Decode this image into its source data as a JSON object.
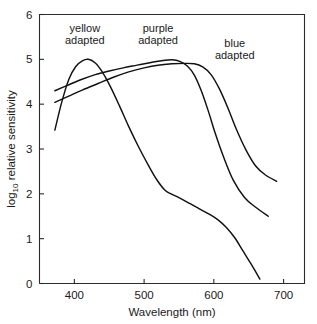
{
  "chart_data": {
    "type": "line",
    "title": "",
    "xlabel": "Wavelength (nm)",
    "ylabel_main": "log",
    "ylabel_sub": "10",
    "ylabel_rest": " relative sensitivity",
    "ylabel_full": "log10 relative sensitivity",
    "xlim": [
      350,
      730
    ],
    "ylim": [
      0,
      6
    ],
    "xticks": [
      400,
      500,
      600,
      700
    ],
    "yticks": [
      0,
      1,
      2,
      3,
      4,
      5,
      6
    ],
    "xtick_labels": [
      "400",
      "500",
      "600",
      "700"
    ],
    "ytick_labels": [
      "0",
      "1",
      "2",
      "3",
      "4",
      "5",
      "6"
    ],
    "grid": false,
    "legend_position": "inline-annotations",
    "series": [
      {
        "name": "yellow adapted",
        "label_line1": "yellow",
        "label_line2": "adapted",
        "color": "#111111",
        "points": [
          [
            372,
            3.42
          ],
          [
            382,
            4.05
          ],
          [
            392,
            4.55
          ],
          [
            402,
            4.84
          ],
          [
            412,
            4.97
          ],
          [
            420,
            5.0
          ],
          [
            430,
            4.92
          ],
          [
            440,
            4.72
          ],
          [
            452,
            4.38
          ],
          [
            465,
            3.95
          ],
          [
            478,
            3.5
          ],
          [
            492,
            3.05
          ],
          [
            506,
            2.64
          ],
          [
            518,
            2.32
          ],
          [
            530,
            2.08
          ],
          [
            540,
            1.99
          ],
          [
            552,
            1.9
          ],
          [
            566,
            1.78
          ],
          [
            580,
            1.66
          ],
          [
            594,
            1.54
          ],
          [
            606,
            1.42
          ],
          [
            618,
            1.25
          ],
          [
            630,
            1.02
          ],
          [
            642,
            0.72
          ],
          [
            654,
            0.42
          ],
          [
            666,
            0.1
          ]
        ]
      },
      {
        "name": "purple adapted",
        "label_line1": "purple",
        "label_line2": "adapted",
        "color": "#111111",
        "points": [
          [
            372,
            4.3
          ],
          [
            390,
            4.42
          ],
          [
            410,
            4.55
          ],
          [
            430,
            4.66
          ],
          [
            450,
            4.74
          ],
          [
            470,
            4.81
          ],
          [
            490,
            4.87
          ],
          [
            510,
            4.93
          ],
          [
            525,
            4.97
          ],
          [
            540,
            4.99
          ],
          [
            552,
            4.95
          ],
          [
            562,
            4.85
          ],
          [
            572,
            4.65
          ],
          [
            582,
            4.3
          ],
          [
            592,
            3.85
          ],
          [
            602,
            3.35
          ],
          [
            614,
            2.82
          ],
          [
            628,
            2.3
          ],
          [
            644,
            1.92
          ],
          [
            660,
            1.7
          ],
          [
            678,
            1.5
          ]
        ]
      },
      {
        "name": "blue adapted",
        "label_line1": "blue",
        "label_line2": "adapted",
        "color": "#111111",
        "points": [
          [
            372,
            4.04
          ],
          [
            392,
            4.18
          ],
          [
            412,
            4.32
          ],
          [
            434,
            4.46
          ],
          [
            456,
            4.6
          ],
          [
            478,
            4.72
          ],
          [
            500,
            4.81
          ],
          [
            520,
            4.87
          ],
          [
            540,
            4.9
          ],
          [
            558,
            4.91
          ],
          [
            572,
            4.9
          ],
          [
            584,
            4.83
          ],
          [
            596,
            4.66
          ],
          [
            608,
            4.34
          ],
          [
            620,
            3.92
          ],
          [
            632,
            3.45
          ],
          [
            646,
            2.98
          ],
          [
            660,
            2.62
          ],
          [
            674,
            2.42
          ],
          [
            690,
            2.28
          ]
        ]
      }
    ],
    "annotations": [
      {
        "text_line1": "yellow",
        "text_line2": "adapted",
        "x": 415,
        "y": 5.62
      },
      {
        "text_line1": "purple",
        "text_line2": "adapted",
        "x": 520,
        "y": 5.62
      },
      {
        "text_line1": "blue",
        "text_line2": "adapted",
        "x": 630,
        "y": 5.28
      }
    ]
  }
}
